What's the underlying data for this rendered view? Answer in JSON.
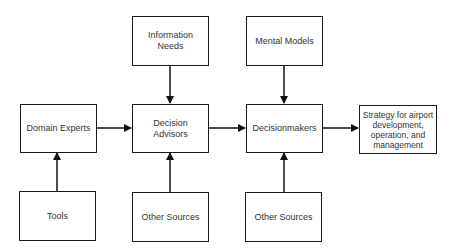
{
  "diagram": {
    "nodes": {
      "information_needs": "Information Needs",
      "mental_models": "Mental Models",
      "domain_experts": "Domain Experts",
      "decision_advisors": "Decision Advisors",
      "decisionmakers": "Decisionmakers",
      "strategy": "Strategy for airport development, operation, and management",
      "tools": "Tools",
      "other_sources_advisors": "Other Sources",
      "other_sources_decisionmakers": "Other Sources"
    },
    "edges": [
      {
        "from": "Information Needs",
        "to": "Decision Advisors"
      },
      {
        "from": "Mental Models",
        "to": "Decisionmakers"
      },
      {
        "from": "Domain Experts",
        "to": "Decision Advisors"
      },
      {
        "from": "Decision Advisors",
        "to": "Decisionmakers"
      },
      {
        "from": "Decisionmakers",
        "to": "Strategy for airport development, operation, and management"
      },
      {
        "from": "Tools",
        "to": "Domain Experts"
      },
      {
        "from": "Other Sources",
        "to": "Decision Advisors"
      },
      {
        "from": "Other Sources",
        "to": "Decisionmakers"
      }
    ]
  }
}
